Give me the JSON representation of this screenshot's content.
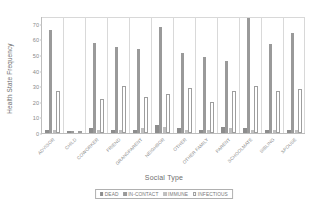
{
  "chart_data": {
    "type": "bar",
    "title": "",
    "xlabel": "Social Type",
    "ylabel": "Health State Frequency",
    "ylim": [
      0,
      75
    ],
    "yticks": [
      0,
      10,
      20,
      30,
      40,
      50,
      60,
      70
    ],
    "grid": false,
    "legend_position": "bottom",
    "categories": [
      "ADVISOR",
      "CHILD",
      "COWORKER",
      "FRIEND",
      "GRANDPARENT",
      "NEIGHBOR",
      "OTHER",
      "OTHER FAMILY",
      "PARENT",
      "SCHOOLMATE",
      "SIBLING",
      "SPOUSE"
    ],
    "series": [
      {
        "name": "DEAD",
        "color": "#8d8d8d",
        "values": [
          2,
          1,
          3,
          2,
          2,
          5,
          3,
          2,
          4,
          3,
          2,
          2
        ]
      },
      {
        "name": "IN-CONTACT",
        "color": "#9a9a9a",
        "values": [
          66,
          1,
          58,
          55,
          54,
          68,
          51,
          49,
          46,
          74,
          57,
          64
        ]
      },
      {
        "name": "IMMUNE",
        "color": "#bfbfbf",
        "values": [
          2,
          0,
          2,
          2,
          3,
          4,
          2,
          2,
          3,
          2,
          2,
          2
        ]
      },
      {
        "name": "INFECTIOUS",
        "color": "#ffffff",
        "values": [
          27,
          0,
          22,
          30,
          23,
          25,
          29,
          20,
          27,
          30,
          27,
          28
        ]
      }
    ]
  },
  "legend": {
    "items": [
      {
        "label": "DEAD"
      },
      {
        "label": "IN-CONTACT"
      },
      {
        "label": "IMMUNE"
      },
      {
        "label": "INFECTIOUS"
      }
    ]
  }
}
